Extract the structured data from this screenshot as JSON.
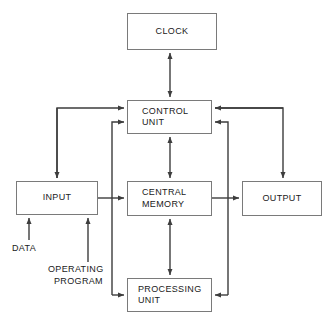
{
  "diagram": {
    "stroke_color": "#4d4d4d",
    "box_border_color": "#7a7a7a",
    "text_color": "#1a1a1a",
    "background": "#ffffff",
    "nodes": [
      {
        "id": "clock",
        "label_lines": [
          "CLOCK"
        ],
        "x": 127,
        "y": 13,
        "w": 90,
        "h": 37
      },
      {
        "id": "control",
        "label_lines": [
          "CONTROL",
          "UNIT"
        ],
        "x": 127,
        "y": 100,
        "w": 85,
        "h": 34
      },
      {
        "id": "input",
        "label_lines": [
          "INPUT"
        ],
        "x": 16,
        "y": 181,
        "w": 82,
        "h": 34
      },
      {
        "id": "memory",
        "label_lines": [
          "CENTRAL",
          "MEMORY"
        ],
        "x": 127,
        "y": 181,
        "w": 85,
        "h": 35
      },
      {
        "id": "output",
        "label_lines": [
          "OUTPUT"
        ],
        "x": 242,
        "y": 181,
        "w": 80,
        "h": 35
      },
      {
        "id": "processing",
        "label_lines": [
          "PROCESSING",
          "UNIT"
        ],
        "x": 127,
        "y": 278,
        "w": 85,
        "h": 34
      }
    ],
    "free_labels": [
      {
        "id": "data",
        "lines": [
          "DATA"
        ],
        "x": 12,
        "y": 243
      },
      {
        "id": "operating",
        "lines": [
          "OPERATING",
          "PROGRAM"
        ],
        "x": 48,
        "y": 264
      }
    ],
    "connections": [
      {
        "id": "memory-to-clock",
        "from": "memory",
        "to": "clock",
        "style": "double"
      },
      {
        "id": "control-to-memory",
        "from": "control",
        "to": "memory",
        "style": "double"
      },
      {
        "id": "memory-to-processing",
        "from": "memory",
        "to": "processing",
        "style": "double"
      },
      {
        "id": "input-to-control",
        "from": "input",
        "to": "control",
        "style": "single"
      },
      {
        "id": "control-to-input",
        "from": "control",
        "to": "input",
        "style": "single"
      },
      {
        "id": "input-to-memory",
        "from": "input",
        "to": "memory",
        "style": "single"
      },
      {
        "id": "memory-to-output",
        "from": "memory",
        "to": "output",
        "style": "single"
      },
      {
        "id": "control-to-output",
        "from": "control",
        "to": "output",
        "style": "single"
      },
      {
        "id": "processing-to-control",
        "from": "processing",
        "to": "control",
        "style": "single"
      },
      {
        "id": "control-to-processing",
        "from": "control",
        "to": "processing",
        "style": "single"
      },
      {
        "id": "data-to-input",
        "from": "data",
        "to": "input",
        "style": "single"
      },
      {
        "id": "program-to-input",
        "from": "operating",
        "to": "input",
        "style": "single"
      }
    ]
  }
}
